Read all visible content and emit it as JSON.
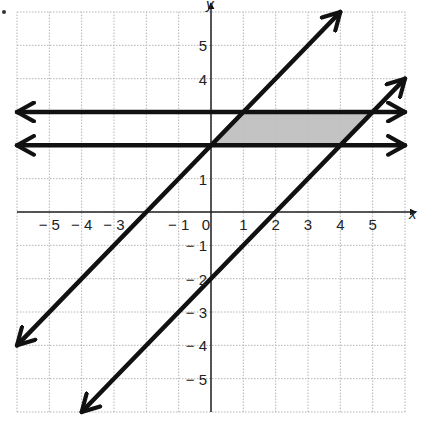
{
  "chart_data": {
    "type": "line",
    "title": "",
    "xlabel": "x",
    "ylabel": "y",
    "xlim": [
      -6,
      6
    ],
    "ylim": [
      -6,
      6
    ],
    "grid": true,
    "x_tick_labels": [
      "-5",
      "-4",
      "-3",
      "-1",
      "0",
      "1",
      "2",
      "3",
      "4",
      "5"
    ],
    "y_tick_labels": [
      "5",
      "4",
      "1",
      "-1",
      "-2",
      "3",
      "-4",
      "-5"
    ],
    "series": [
      {
        "name": "y = 3",
        "points": [
          [
            -6,
            3
          ],
          [
            6,
            3
          ]
        ],
        "arrows": "both"
      },
      {
        "name": "y = 2",
        "points": [
          [
            -6,
            2
          ],
          [
            6,
            2
          ]
        ],
        "arrows": "both"
      },
      {
        "name": "y = x + 2",
        "points": [
          [
            -6,
            -4
          ],
          [
            4,
            6
          ]
        ],
        "arrows": "both"
      },
      {
        "name": "y = x - 2",
        "points": [
          [
            -4,
            -6
          ],
          [
            6,
            4
          ]
        ],
        "arrows": "both"
      }
    ],
    "shaded_region": {
      "shape": "parallelogram",
      "vertices": [
        [
          0,
          2
        ],
        [
          1,
          3
        ],
        [
          5,
          3
        ],
        [
          4,
          2
        ]
      ],
      "color": "#bdbdbd"
    },
    "colors": {
      "line": "#111111",
      "grid": "#b5b5b5",
      "axis": "#222222"
    }
  },
  "labels": {
    "x_axis": "x",
    "y_axis": "y",
    "x_ticks": [
      {
        "v": -5,
        "t": "− 5"
      },
      {
        "v": -4,
        "t": "− 4"
      },
      {
        "v": -3,
        "t": "− 3"
      },
      {
        "v": -1,
        "t": "− 1"
      },
      {
        "v": 0,
        "t": "0"
      },
      {
        "v": 1,
        "t": "1"
      },
      {
        "v": 2,
        "t": "2"
      },
      {
        "v": 3,
        "t": "3"
      },
      {
        "v": 4,
        "t": "4"
      },
      {
        "v": 5,
        "t": "5"
      }
    ],
    "y_ticks": [
      {
        "v": 5,
        "t": "5"
      },
      {
        "v": 4,
        "t": "4"
      },
      {
        "v": 1,
        "t": "1"
      },
      {
        "v": -1,
        "t": "− 1"
      },
      {
        "v": -2,
        "t": "− 2"
      },
      {
        "v": -3,
        "t": "− 3"
      },
      {
        "v": -4,
        "t": "− 4"
      },
      {
        "v": -5,
        "t": "− 5"
      }
    ]
  }
}
